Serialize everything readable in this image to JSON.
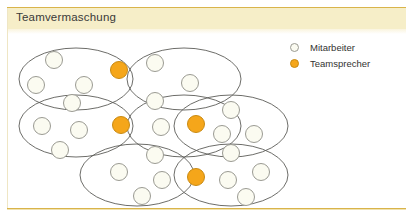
{
  "header": {
    "title": "Teamvermaschung"
  },
  "colors": {
    "band_background": "#f6eec8",
    "band_rule": "#d9b44a",
    "employee_fill": "#fbfbf1",
    "employee_stroke": "#9a9a92",
    "speaker_fill": "#f5a61a",
    "speaker_stroke": "#c98a12",
    "ellipse_stroke": "#5c5c58",
    "title_text": "#3a3a38",
    "legend_text": "#333331"
  },
  "legend": {
    "items": [
      {
        "marker": "employee-circle-icon",
        "label": "Mitarbeiter",
        "type": "employee"
      },
      {
        "marker": "speaker-circle-icon",
        "label": "Teamsprecher",
        "type": "speaker"
      }
    ]
  },
  "diagram": {
    "name": "team-mesh-diagram",
    "teams": [
      {
        "id": "team-top-left",
        "cx": 76,
        "cy": 79,
        "rx": 57,
        "ry": 31
      },
      {
        "id": "team-top-right",
        "cx": 184,
        "cy": 79,
        "rx": 57,
        "ry": 31
      },
      {
        "id": "team-middle-left",
        "cx": 76,
        "cy": 126,
        "rx": 57,
        "ry": 31
      },
      {
        "id": "team-middle-right",
        "cx": 184,
        "cy": 126,
        "rx": 57,
        "ry": 31
      },
      {
        "id": "team-far-right",
        "cx": 231,
        "cy": 126,
        "rx": 57,
        "ry": 31
      },
      {
        "id": "team-bottom-left",
        "cx": 137,
        "cy": 175,
        "rx": 57,
        "ry": 31
      },
      {
        "id": "team-bottom-right",
        "cx": 231,
        "cy": 175,
        "rx": 57,
        "ry": 31
      }
    ],
    "nodes": [
      {
        "id": "n01",
        "type": "employee",
        "cx": 54,
        "cy": 60
      },
      {
        "id": "n02",
        "type": "employee",
        "cx": 36,
        "cy": 85
      },
      {
        "id": "n03",
        "type": "employee",
        "cx": 84,
        "cy": 85
      },
      {
        "id": "n04",
        "type": "speaker",
        "cx": 119,
        "cy": 70
      },
      {
        "id": "n05",
        "type": "employee",
        "cx": 155,
        "cy": 63
      },
      {
        "id": "n06",
        "type": "employee",
        "cx": 190,
        "cy": 83
      },
      {
        "id": "n07",
        "type": "employee",
        "cx": 72,
        "cy": 103
      },
      {
        "id": "n08",
        "type": "employee",
        "cx": 155,
        "cy": 101
      },
      {
        "id": "n09",
        "type": "employee",
        "cx": 42,
        "cy": 126
      },
      {
        "id": "n10",
        "type": "employee",
        "cx": 79,
        "cy": 130
      },
      {
        "id": "n11",
        "type": "employee",
        "cx": 60,
        "cy": 150
      },
      {
        "id": "n12",
        "type": "speaker",
        "cx": 121,
        "cy": 125
      },
      {
        "id": "n13",
        "type": "employee",
        "cx": 161,
        "cy": 127
      },
      {
        "id": "n14",
        "type": "speaker",
        "cx": 196,
        "cy": 124
      },
      {
        "id": "n15",
        "type": "employee",
        "cx": 231,
        "cy": 110
      },
      {
        "id": "n16",
        "type": "employee",
        "cx": 222,
        "cy": 134
      },
      {
        "id": "n17",
        "type": "employee",
        "cx": 254,
        "cy": 134
      },
      {
        "id": "n18",
        "type": "employee",
        "cx": 155,
        "cy": 155
      },
      {
        "id": "n19",
        "type": "employee",
        "cx": 231,
        "cy": 153
      },
      {
        "id": "n20",
        "type": "employee",
        "cx": 119,
        "cy": 172
      },
      {
        "id": "n21",
        "type": "employee",
        "cx": 162,
        "cy": 180
      },
      {
        "id": "n22",
        "type": "employee",
        "cx": 142,
        "cy": 196
      },
      {
        "id": "n23",
        "type": "speaker",
        "cx": 196,
        "cy": 177
      },
      {
        "id": "n24",
        "type": "employee",
        "cx": 228,
        "cy": 180
      },
      {
        "id": "n25",
        "type": "employee",
        "cx": 261,
        "cy": 172
      },
      {
        "id": "n26",
        "type": "employee",
        "cx": 246,
        "cy": 197
      }
    ],
    "node_radius": 8.5
  }
}
